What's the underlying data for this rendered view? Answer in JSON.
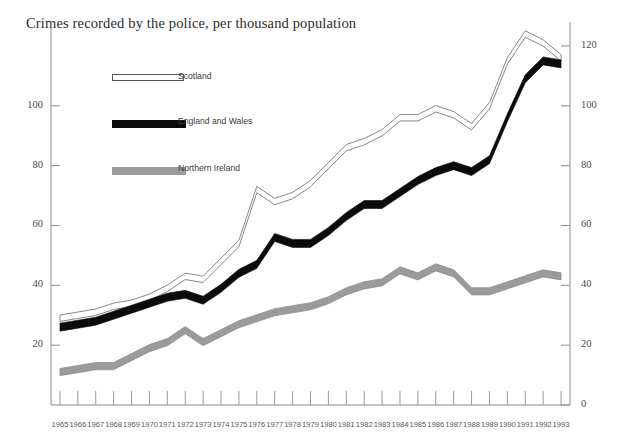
{
  "chart_data": {
    "type": "line",
    "title": "Crimes recorded by the police, per thousand population",
    "xlabel": "",
    "ylabel": "",
    "grid": false,
    "legend_position": "upper-left-inside",
    "x": [
      1965,
      1966,
      1967,
      1968,
      1969,
      1970,
      1971,
      1972,
      1973,
      1974,
      1975,
      1976,
      1977,
      1978,
      1979,
      1980,
      1981,
      1982,
      1983,
      1984,
      1985,
      1986,
      1987,
      1988,
      1989,
      1990,
      1991,
      1992,
      1993
    ],
    "xtick_labels": [
      "1965",
      "1966",
      "1967",
      "1968",
      "1969",
      "1970",
      "1971",
      "1972",
      "1973",
      "1974",
      "1975",
      "1976",
      "1977",
      "1978",
      "1979",
      "1980",
      "1981",
      "1982",
      "1983",
      "1984",
      "1985",
      "1986",
      "1987",
      "1988",
      "1989",
      "1990",
      "1991",
      "1992",
      "1993"
    ],
    "left_axis": {
      "ticks": [
        20,
        40,
        60,
        80,
        100
      ],
      "tick_labels": [
        "20",
        "40",
        "60",
        "80",
        "100"
      ],
      "ylim": [
        0,
        128
      ]
    },
    "right_axis": {
      "ticks": [
        0,
        20,
        40,
        60,
        80,
        100,
        120
      ],
      "tick_labels": [
        "0",
        "20",
        "40",
        "60",
        "80",
        "100",
        "120"
      ],
      "ylim": [
        0,
        128
      ]
    },
    "series": [
      {
        "name": "Scotland",
        "color": "#ffffff",
        "outline_color": "#6a6a6a",
        "style": "hollow-band",
        "values": [
          29,
          30,
          31,
          33,
          34,
          36,
          39,
          43,
          42,
          48,
          54,
          72,
          68,
          70,
          74,
          80,
          86,
          88,
          91,
          96,
          96,
          99,
          97,
          93,
          100,
          115,
          124,
          121,
          116
        ]
      },
      {
        "name": "England and Wales",
        "color": "#0b0b0b",
        "style": "thick-band",
        "values": [
          26,
          27,
          28,
          30,
          32,
          34,
          36,
          37,
          35,
          39,
          44,
          47,
          56,
          54,
          54,
          58,
          63,
          67,
          67,
          71,
          75,
          78,
          80,
          78,
          82,
          96,
          109,
          115,
          114
        ]
      },
      {
        "name": "Northern Ireland",
        "color": "#9b9b9b",
        "style": "thick-band",
        "values": [
          11,
          12,
          13,
          13,
          16,
          19,
          21,
          25,
          21,
          24,
          27,
          29,
          31,
          32,
          33,
          35,
          38,
          40,
          41,
          45,
          43,
          46,
          44,
          38,
          38,
          40,
          42,
          44,
          43
        ]
      }
    ]
  },
  "legend": {
    "items": [
      {
        "label": "Scotland",
        "swatch": "sw-scotland"
      },
      {
        "label": "England and Wales",
        "swatch": "sw-ew"
      },
      {
        "label": "Northern Ireland",
        "swatch": "sw-ni"
      }
    ]
  }
}
